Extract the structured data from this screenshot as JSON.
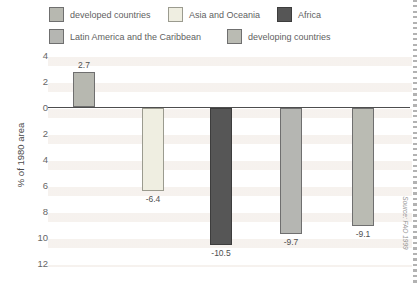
{
  "legend": {
    "items": [
      {
        "label": "developed countries",
        "color": "#b7b8b0",
        "border": "#6f6f6f"
      },
      {
        "label": "Asia and Oceania",
        "color": "#efeee1",
        "border": "#9b9b8f"
      },
      {
        "label": "Africa",
        "color": "#565656",
        "border": "#3d3d3d"
      },
      {
        "label": "Latin America and the Caribbean",
        "color": "#b5b6b2",
        "border": "#6f6f6f"
      },
      {
        "label": "developing countries",
        "color": "#babbb3",
        "border": "#6f6f6f"
      }
    ]
  },
  "chart_data": {
    "type": "bar",
    "title": "",
    "xlabel": "",
    "ylabel": "% of 1980 area",
    "categories": [
      "developed countries",
      "Asia and Oceania",
      "Africa",
      "Latin America and the Caribbean",
      "developing countries"
    ],
    "values": [
      2.7,
      -6.4,
      -10.5,
      -9.7,
      -9.1
    ],
    "value_labels": [
      "2.7",
      "-6.4",
      "-10.5",
      "-9.7",
      "-9.1"
    ],
    "bar_colors": [
      "#b7b8b0",
      "#efeee1",
      "#565656",
      "#b5b6b2",
      "#babbb3"
    ],
    "bar_borders": [
      "#6f6f6f",
      "#9b9b8f",
      "#3d3d3d",
      "#6f6f6f",
      "#6f6f6f"
    ],
    "ylim": [
      4,
      -12
    ],
    "ytick_values": [
      4,
      2,
      0,
      -2,
      -4,
      -6,
      -8,
      -10,
      -12
    ],
    "ytick_labels": [
      "4",
      "2",
      "0",
      "2",
      "4",
      "6",
      "8",
      "10",
      "12"
    ],
    "grid": false,
    "legend_position": "top",
    "source": "Source: FAO 1999"
  }
}
